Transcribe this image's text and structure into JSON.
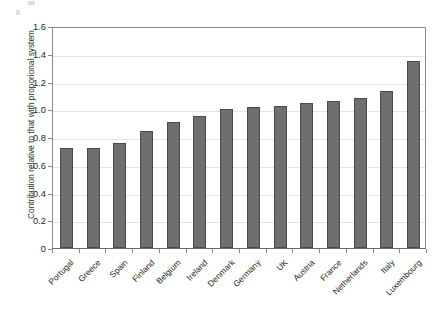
{
  "chart_data": {
    "type": "bar",
    "title": "",
    "subtitle": "",
    "xlabel": "",
    "ylabel": "Contribution relative to that with proporional system",
    "categories": [
      "Portugal",
      "Greece",
      "Spain",
      "Finland",
      "Belgium",
      "Ireland",
      "Denmark",
      "Germany",
      "UK",
      "Austria",
      "France",
      "Netherlands",
      "Italy",
      "Luxembourg"
    ],
    "values": [
      0.72,
      0.72,
      0.755,
      0.845,
      0.905,
      0.95,
      1.0,
      1.015,
      1.025,
      1.045,
      1.06,
      1.08,
      1.13,
      1.35
    ],
    "ylim": [
      0,
      1.6
    ],
    "ytick_values": [
      0,
      0.2,
      0.4,
      0.6,
      0.8,
      1.0,
      1.2,
      1.4,
      1.6
    ],
    "ytick_labels": [
      "0",
      "0.2",
      "0.4",
      "0.6",
      "0.8",
      "1.0",
      "1.2",
      "1.4",
      "1.6"
    ],
    "grid": "horizontal",
    "legend": "none",
    "bar_color": "#6f6f6f",
    "bar_border_color": "#4a4a4a",
    "axis_color": "#8a8a8a",
    "gridline_color": "#e2e2e2",
    "text_color": "#1f1f1f",
    "background_color": "#ffffff",
    "xtick_label_rotation": -45
  }
}
